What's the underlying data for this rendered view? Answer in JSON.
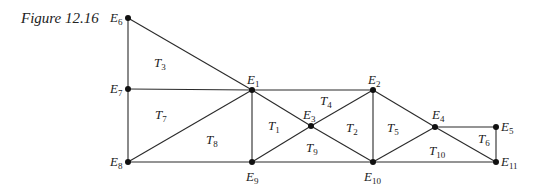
{
  "caption": "Figure 12.16",
  "nodes": [
    {
      "id": "E1",
      "name": "E",
      "sub": "1",
      "x": 252,
      "y": 90,
      "lx": 247,
      "ly": 84
    },
    {
      "id": "E2",
      "name": "E",
      "sub": "2",
      "x": 373,
      "y": 90,
      "lx": 368,
      "ly": 84
    },
    {
      "id": "E3",
      "name": "E",
      "sub": "3",
      "x": 311,
      "y": 126,
      "lx": 303,
      "ly": 119
    },
    {
      "id": "E4",
      "name": "E",
      "sub": "4",
      "x": 435,
      "y": 127,
      "lx": 432,
      "ly": 119
    },
    {
      "id": "E5",
      "name": "E",
      "sub": "5",
      "x": 496,
      "y": 127,
      "lx": 501,
      "ly": 131
    },
    {
      "id": "E6",
      "name": "E",
      "sub": "6",
      "x": 128,
      "y": 18,
      "lx": 110,
      "ly": 22
    },
    {
      "id": "E7",
      "name": "E",
      "sub": "7",
      "x": 128,
      "y": 89,
      "lx": 110,
      "ly": 93
    },
    {
      "id": "E8",
      "name": "E",
      "sub": "8",
      "x": 128,
      "y": 162,
      "lx": 110,
      "ly": 166
    },
    {
      "id": "E9",
      "name": "E",
      "sub": "9",
      "x": 252,
      "y": 162,
      "lx": 246,
      "ly": 181
    },
    {
      "id": "E10",
      "name": "E",
      "sub": "10",
      "x": 373,
      "y": 162,
      "lx": 364,
      "ly": 181
    },
    {
      "id": "E11",
      "name": "E",
      "sub": "11",
      "x": 496,
      "y": 162,
      "lx": 501,
      "ly": 166
    }
  ],
  "edges": [
    [
      "E6",
      "E7"
    ],
    [
      "E7",
      "E8"
    ],
    [
      "E6",
      "E1"
    ],
    [
      "E7",
      "E1"
    ],
    [
      "E1",
      "E2"
    ],
    [
      "E8",
      "E9"
    ],
    [
      "E9",
      "E10"
    ],
    [
      "E10",
      "E11"
    ],
    [
      "E8",
      "E1"
    ],
    [
      "E1",
      "E9"
    ],
    [
      "E1",
      "E3"
    ],
    [
      "E3",
      "E10"
    ],
    [
      "E9",
      "E3"
    ],
    [
      "E3",
      "E2"
    ],
    [
      "E2",
      "E10"
    ],
    [
      "E2",
      "E4"
    ],
    [
      "E4",
      "E11"
    ],
    [
      "E10",
      "E4"
    ],
    [
      "E4",
      "E5"
    ],
    [
      "E5",
      "E11"
    ]
  ],
  "triangles": [
    {
      "id": "T1",
      "name": "T",
      "sub": "1",
      "x": 268,
      "y": 130
    },
    {
      "id": "T2",
      "name": "T",
      "sub": "2",
      "x": 346,
      "y": 132
    },
    {
      "id": "T3",
      "name": "T",
      "sub": "3",
      "x": 154,
      "y": 67
    },
    {
      "id": "T4",
      "name": "T",
      "sub": "4",
      "x": 320,
      "y": 105
    },
    {
      "id": "T5",
      "name": "T",
      "sub": "5",
      "x": 387,
      "y": 132
    },
    {
      "id": "T6",
      "name": "T",
      "sub": "6",
      "x": 478,
      "y": 143
    },
    {
      "id": "T7",
      "name": "T",
      "sub": "7",
      "x": 155,
      "y": 119
    },
    {
      "id": "T8",
      "name": "T",
      "sub": "8",
      "x": 206,
      "y": 144
    },
    {
      "id": "T9",
      "name": "T",
      "sub": "9",
      "x": 306,
      "y": 152
    },
    {
      "id": "T10",
      "name": "T",
      "sub": "10",
      "x": 429,
      "y": 155
    }
  ]
}
